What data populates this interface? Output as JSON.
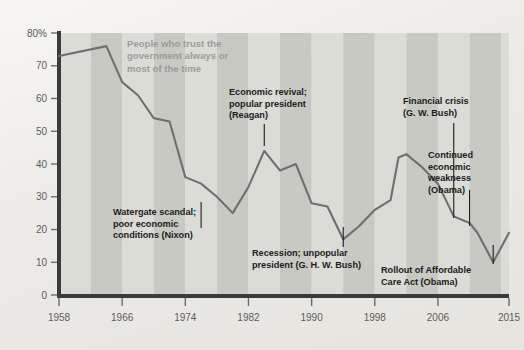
{
  "chart_data": {
    "type": "line",
    "title": "",
    "subtitle": "",
    "xlabel": "",
    "ylabel": "",
    "series_name": "People who trust the government always or most of the time",
    "xlim": [
      1958,
      2015
    ],
    "ylim": [
      0,
      80
    ],
    "grid": false,
    "legend_position": "inline-annotation",
    "x_ticks": [
      "1958",
      "1966",
      "1974",
      "1982",
      "1990",
      "1998",
      "2006",
      "2015"
    ],
    "x_tick_values": [
      1958,
      1966,
      1974,
      1982,
      1990,
      1998,
      2006,
      2015
    ],
    "y_ticks": [
      "0",
      "10",
      "20",
      "30",
      "40",
      "50",
      "60",
      "70",
      "80%"
    ],
    "y_tick_values": [
      0,
      10,
      20,
      30,
      40,
      50,
      60,
      70,
      80
    ],
    "x": [
      1958,
      1964,
      1966,
      1968,
      1970,
      1972,
      1974,
      1976,
      1978,
      1980,
      1982,
      1984,
      1986,
      1988,
      1990,
      1992,
      1994,
      1996,
      1998,
      2000,
      2001,
      2002,
      2004,
      2006,
      2008,
      2010,
      2011,
      2013,
      2015
    ],
    "values": [
      73,
      76,
      65,
      61,
      54,
      53,
      36,
      34,
      30,
      25,
      33,
      44,
      38,
      40,
      28,
      27,
      17,
      21,
      26,
      29,
      42,
      43,
      39,
      34,
      24,
      22,
      19,
      10,
      19
    ],
    "series": [
      {
        "name": "People who trust the government always or most of the time",
        "color": "#6f6f6f",
        "values": [
          73,
          76,
          65,
          61,
          54,
          53,
          36,
          34,
          30,
          25,
          33,
          44,
          38,
          40,
          28,
          27,
          17,
          21,
          26,
          29,
          42,
          43,
          39,
          34,
          24,
          22,
          19,
          10,
          19
        ]
      }
    ],
    "annotations": [
      {
        "id": "legend",
        "text": "People who trust the\ngovernment always or\nmost of the time",
        "color": "#9c9c99"
      },
      {
        "id": "watergate",
        "text": "Watergate scandal;\npoor economic\nconditions (Nixon)",
        "year": 1976,
        "value": 34
      },
      {
        "id": "reagan",
        "text": "Economic revival;\npopular president\n(Reagan)",
        "year": 1984,
        "value": 44
      },
      {
        "id": "ghwbush",
        "text": "Recession; unpopular\npresident (G. H. W. Bush)",
        "year": 1994,
        "value": 17
      },
      {
        "id": "financial-crisis",
        "text": "Financial crisis\n(G. W. Bush)",
        "year": 2008,
        "value": 24
      },
      {
        "id": "continued-weakness",
        "text": "Continued\neconomic\nweakness\n(Obama)",
        "year": 2010,
        "value": 22
      },
      {
        "id": "aca-rollout",
        "text": "Rollout of Affordable\nCare Act (Obama)",
        "year": 2013,
        "value": 10
      }
    ],
    "style": {
      "background": "#efeee9",
      "plot_band_light": "#dcdcd7",
      "plot_band_dark": "#c9c9c3",
      "axis_color": "#3b3b39",
      "line_color": "#6f6f6f",
      "tick_text_color": "#5d5d5d"
    }
  }
}
